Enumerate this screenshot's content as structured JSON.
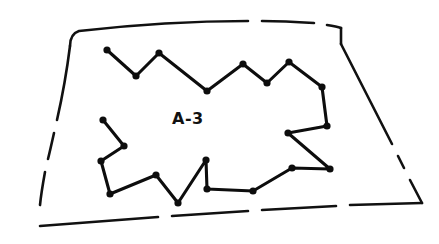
{
  "figure": {
    "background_color": "#ffffff",
    "ink_color": "#111111",
    "width": 439,
    "height": 244
  },
  "labels": {
    "region": {
      "text": "A-3",
      "x": 172,
      "y": 111,
      "font_size": 16,
      "bold": true
    }
  },
  "outer_boundary": {
    "name": "dashed-survey-boundary",
    "style": "dashed",
    "stroke_color": "#111111",
    "stroke_width": 2.6,
    "segments": [
      "M 70 46 C 70 38 73 33 79 31 C 140 24 205 21 248 21",
      "M 262 21 C 281 21 299 22 314 23",
      "M 327 25 C 333 26 338 27 341 28",
      "M 341 28 L 341 44",
      "M 341 44 L 392 144",
      "M 398 156 L 404 168",
      "M 410 180 L 422 203",
      "M 422 203 L 350 205",
      "M 336 206 L 262 210",
      "M 248 211 L 172 216",
      "M 158 217 C 110 221 70 224 40 226",
      "M 70 46 C 67 70 62 98 57 120",
      "M 54 133 C 52 142 50 151 48 159",
      "M 45 172 C 43 183 41 195 40 205"
    ]
  },
  "inner_polygon": {
    "name": "irregular-parcel-polygon",
    "stroke_color": "#0d0d0d",
    "stroke_width": 3.1,
    "closed": false,
    "vertex_dot_radius": 3.6,
    "vertices": [
      {
        "x": 107,
        "y": 50
      },
      {
        "x": 136,
        "y": 76
      },
      {
        "x": 159,
        "y": 53
      },
      {
        "x": 207,
        "y": 91
      },
      {
        "x": 243,
        "y": 64
      },
      {
        "x": 267,
        "y": 83
      },
      {
        "x": 289,
        "y": 62
      },
      {
        "x": 322,
        "y": 87
      },
      {
        "x": 327,
        "y": 126
      },
      {
        "x": 288,
        "y": 133
      },
      {
        "x": 330,
        "y": 169
      },
      {
        "x": 292,
        "y": 168
      },
      {
        "x": 253,
        "y": 191
      },
      {
        "x": 207,
        "y": 189
      },
      {
        "x": 206,
        "y": 160
      },
      {
        "x": 178,
        "y": 203
      },
      {
        "x": 156,
        "y": 175
      },
      {
        "x": 110,
        "y": 194
      },
      {
        "x": 101,
        "y": 161
      },
      {
        "x": 124,
        "y": 146
      },
      {
        "x": 103,
        "y": 120
      }
    ]
  }
}
